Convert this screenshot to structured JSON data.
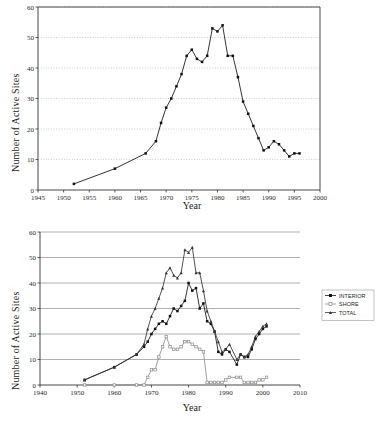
{
  "figures": [
    {
      "id": "chart-total-sites",
      "axis_title_y": "Number of Active Sites",
      "axis_title_x": "Year",
      "chart_data": {
        "type": "line",
        "title": "",
        "xlabel": "Year",
        "ylabel": "Number of Active Sites",
        "xlim": [
          1945,
          2000
        ],
        "ylim": [
          0,
          60
        ],
        "xticks": [
          1945,
          1950,
          1955,
          1960,
          1965,
          1970,
          1975,
          1980,
          1985,
          1990,
          1995,
          2000
        ],
        "yticks": [
          0,
          10,
          20,
          30,
          40,
          50,
          60
        ],
        "grid": "horizontal-dotted",
        "legend": "none",
        "marker": "filled-square",
        "series": [
          {
            "name": "Total active sites",
            "x": [
              1952,
              1960,
              1966,
              1968,
              1969,
              1970,
              1971,
              1972,
              1973,
              1974,
              1975,
              1976,
              1977,
              1978,
              1979,
              1980,
              1981,
              1982,
              1983,
              1984,
              1985,
              1986,
              1987,
              1988,
              1989,
              1990,
              1991,
              1992,
              1993,
              1994,
              1995,
              1996
            ],
            "values": [
              2,
              7,
              12,
              16,
              22,
              27,
              30,
              34,
              38,
              44,
              46,
              43,
              42,
              44,
              53,
              52,
              54,
              44,
              44,
              37,
              29,
              25,
              21,
              17,
              13,
              14,
              16,
              15,
              13,
              11,
              12,
              12
            ]
          }
        ]
      }
    },
    {
      "id": "chart-interior-shore-total",
      "axis_title_y": "Number of Active Sites",
      "axis_title_x": "Year",
      "chart_data": {
        "type": "line",
        "title": "",
        "xlabel": "Year",
        "ylabel": "Number of Active Sites",
        "xlim": [
          1940,
          2010
        ],
        "ylim": [
          0,
          60
        ],
        "xticks": [
          1940,
          1950,
          1960,
          1970,
          1980,
          1990,
          2000,
          2010
        ],
        "yticks": [
          0,
          10,
          20,
          30,
          40,
          50,
          60
        ],
        "grid": "horizontal-solid",
        "legend": "right",
        "legend_entries": [
          "INTERIOR",
          "SHORE",
          "TOTAL"
        ],
        "series": [
          {
            "name": "INTERIOR",
            "marker": "filled-square",
            "color": "#111111",
            "x": [
              1952,
              1960,
              1966,
              1968,
              1969,
              1970,
              1971,
              1972,
              1973,
              1974,
              1975,
              1976,
              1977,
              1978,
              1979,
              1980,
              1981,
              1982,
              1983,
              1984,
              1985,
              1986,
              1987,
              1988,
              1989,
              1990,
              1991,
              1993,
              1994,
              1995,
              1996,
              1997,
              1998,
              1999,
              2000,
              2001
            ],
            "values": [
              2,
              7,
              12,
              15,
              17,
              20,
              22,
              24,
              25,
              24,
              27,
              30,
              29,
              31,
              33,
              40,
              37,
              38,
              30,
              32,
              25,
              24,
              21,
              13,
              12,
              14,
              13,
              8,
              12,
              11,
              11,
              14,
              18,
              20,
              22,
              23
            ]
          },
          {
            "name": "SHORE",
            "marker": "open-square",
            "color": "#8c8c8c",
            "x": [
              1952,
              1960,
              1966,
              1968,
              1969,
              1970,
              1971,
              1972,
              1973,
              1974,
              1975,
              1976,
              1977,
              1978,
              1979,
              1980,
              1981,
              1982,
              1983,
              1984,
              1985,
              1986,
              1987,
              1988,
              1989,
              1990,
              1991,
              1993,
              1994,
              1995,
              1996,
              1997,
              1998,
              1999,
              2000,
              2001
            ],
            "values": [
              0,
              0,
              0,
              0,
              3,
              6,
              6,
              11,
              15,
              19,
              15,
              14,
              14,
              15,
              17,
              17,
              16,
              15,
              14,
              13,
              1,
              1,
              1,
              1,
              1,
              2,
              3,
              3,
              3,
              1,
              1,
              1,
              1,
              2,
              2,
              3
            ]
          },
          {
            "name": "TOTAL",
            "marker": "triangle",
            "color": "#333333",
            "x": [
              1952,
              1960,
              1966,
              1968,
              1969,
              1970,
              1971,
              1972,
              1973,
              1974,
              1975,
              1976,
              1977,
              1978,
              1979,
              1980,
              1981,
              1982,
              1983,
              1984,
              1985,
              1986,
              1987,
              1988,
              1989,
              1990,
              1991,
              1993,
              1994,
              1995,
              1996,
              1997,
              1998,
              1999,
              2000,
              2001
            ],
            "values": [
              2,
              7,
              12,
              16,
              22,
              27,
              30,
              34,
              38,
              44,
              46,
              43,
              42,
              44,
              53,
              52,
              54,
              44,
              44,
              37,
              29,
              25,
              21,
              17,
              13,
              14,
              16,
              10,
              12,
              11,
              12,
              15,
              19,
              21,
              23,
              24
            ]
          }
        ]
      }
    }
  ],
  "footer_caption_partial": ""
}
